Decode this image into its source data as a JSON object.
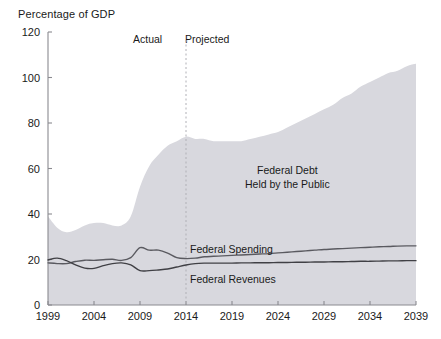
{
  "chart_data": {
    "type": "area",
    "title": "",
    "ylabel": "Percentage of GDP",
    "xlabel": "",
    "ylim": [
      0,
      120
    ],
    "xlim": [
      1999,
      2039
    ],
    "yticks": [
      0,
      20,
      40,
      60,
      80,
      100,
      120
    ],
    "xticks": [
      1999,
      2004,
      2009,
      2014,
      2019,
      2024,
      2029,
      2034,
      2039
    ],
    "grid": false,
    "legend_position": "inline-annotations",
    "divider": {
      "x": 2014,
      "left_label": "Actual",
      "right_label": "Projected"
    },
    "series": [
      {
        "name": "Federal Debt Held by the Public",
        "render": "area",
        "fill_color": "#d8d8de",
        "x": [
          1999,
          2000,
          2001,
          2002,
          2003,
          2004,
          2005,
          2006,
          2007,
          2008,
          2009,
          2010,
          2011,
          2012,
          2013,
          2014,
          2015,
          2016,
          2017,
          2018,
          2019,
          2020,
          2021,
          2022,
          2023,
          2024,
          2025,
          2026,
          2027,
          2028,
          2029,
          2030,
          2031,
          2032,
          2033,
          2034,
          2035,
          2036,
          2037,
          2038,
          2039
        ],
        "values": [
          39,
          34,
          32,
          33,
          35,
          36,
          36,
          35,
          35,
          39,
          52,
          61,
          66,
          70,
          72,
          74,
          73,
          73,
          72,
          72,
          72,
          72,
          73,
          74,
          75,
          76,
          78,
          80,
          82,
          84,
          86,
          88,
          91,
          93,
          96,
          98,
          100,
          102,
          103,
          105,
          106
        ]
      },
      {
        "name": "Federal Spending",
        "render": "line",
        "line_color": "#5a5a60",
        "x": [
          1999,
          2000,
          2001,
          2002,
          2003,
          2004,
          2005,
          2006,
          2007,
          2008,
          2009,
          2010,
          2011,
          2012,
          2013,
          2014,
          2015,
          2016,
          2017,
          2018,
          2019,
          2020,
          2021,
          2022,
          2023,
          2024,
          2025,
          2026,
          2027,
          2028,
          2029,
          2030,
          2031,
          2032,
          2033,
          2034,
          2035,
          2036,
          2037,
          2038,
          2039
        ],
        "values": [
          18.5,
          18.2,
          18.2,
          19.1,
          19.7,
          19.6,
          19.9,
          20.1,
          19.6,
          20.8,
          25.2,
          24.1,
          24.1,
          22.8,
          20.8,
          20.4,
          20.6,
          21.2,
          21.4,
          21.6,
          21.8,
          22.0,
          22.2,
          22.4,
          22.6,
          22.9,
          23.2,
          23.5,
          23.8,
          24.1,
          24.4,
          24.6,
          24.8,
          25.0,
          25.2,
          25.4,
          25.6,
          25.7,
          25.9,
          26.0,
          26.0
        ]
      },
      {
        "name": "Federal Revenues",
        "render": "line",
        "line_color": "#404045",
        "x": [
          1999,
          2000,
          2001,
          2002,
          2003,
          2004,
          2005,
          2006,
          2007,
          2008,
          2009,
          2010,
          2011,
          2012,
          2013,
          2014,
          2015,
          2016,
          2017,
          2018,
          2019,
          2020,
          2021,
          2022,
          2023,
          2024,
          2025,
          2026,
          2027,
          2028,
          2029,
          2030,
          2031,
          2032,
          2033,
          2034,
          2035,
          2036,
          2037,
          2038,
          2039
        ],
        "values": [
          19.8,
          20.6,
          19.5,
          17.6,
          16.2,
          16.1,
          17.3,
          18.2,
          18.5,
          17.6,
          15.1,
          15.1,
          15.4,
          15.8,
          16.7,
          17.6,
          18.2,
          18.4,
          18.4,
          18.4,
          18.4,
          18.5,
          18.5,
          18.6,
          18.6,
          18.7,
          18.7,
          18.8,
          18.8,
          18.9,
          18.9,
          19.0,
          19.0,
          19.1,
          19.2,
          19.2,
          19.3,
          19.4,
          19.4,
          19.5,
          19.5
        ]
      }
    ],
    "annotations": [
      {
        "name": "federal-debt-label",
        "line1": "Federal Debt",
        "line2": "Held by the Public"
      },
      {
        "name": "federal-spending-label",
        "text": "Federal Spending"
      },
      {
        "name": "federal-revenues-label",
        "text": "Federal Revenues"
      }
    ]
  },
  "colors": {
    "area_fill": "#d8d8de",
    "spending_line": "#5a5a60",
    "revenues_line": "#404045",
    "axis": "#8a8a90",
    "divider": "#b0b0b6",
    "text": "#1a1a1a"
  }
}
